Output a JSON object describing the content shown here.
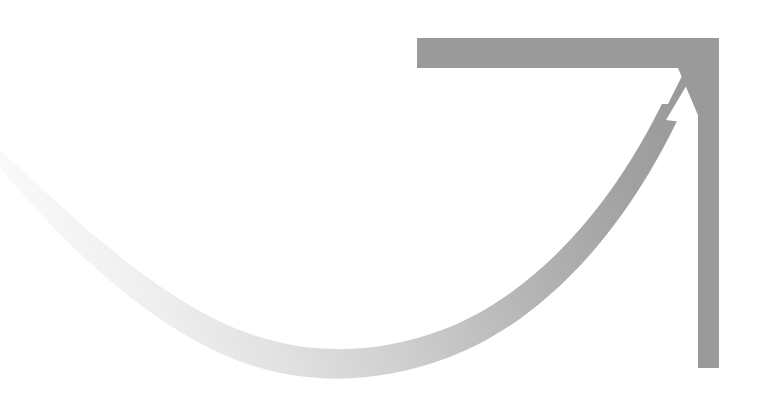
{
  "canvas": {
    "width": 780,
    "height": 409,
    "background": "#ffffff",
    "title": "Upward growth arrow graphic"
  },
  "palette": {
    "background": "#ffffff",
    "bracket_gray": "#9a9a9a",
    "curve_dark": "#9a9a9a",
    "curve_mid": "#c6c6c6",
    "curve_light": "#e9e9e9",
    "curve_faint": "#fbfbfb"
  },
  "shapes": {
    "top_bar": {
      "name": "top-horizontal-bar",
      "x": 417,
      "y": 38,
      "width": 302,
      "height": 30,
      "fill": "#9a9a9a"
    },
    "right_bar": {
      "name": "right-vertical-bar",
      "x": 698,
      "y": 38,
      "width": 21,
      "height": 330,
      "fill": "#9a9a9a"
    },
    "arrow_notch": {
      "name": "arrow-head-notch",
      "description": "white triangular wedge cut between the bracket corner and the rising curve",
      "points": "672,108 698,68 698,112",
      "fill": "#ffffff"
    },
    "curve": {
      "name": "sweeping-growth-curve",
      "description": "J shaped swoosh fading from near-white at far left to mid gray where it meets the arrow head",
      "stroke_width_left": 14,
      "stroke_width_right": 26,
      "start": [
        0,
        152
      ],
      "low_point": [
        340,
        350
      ],
      "end": [
        692,
        66
      ],
      "gradient_stops": [
        {
          "offset": "0%",
          "color": "#fdfdfd"
        },
        {
          "offset": "16%",
          "color": "#f2f2f2"
        },
        {
          "offset": "34%",
          "color": "#e2e2e2"
        },
        {
          "offset": "52%",
          "color": "#cdcdcd"
        },
        {
          "offset": "70%",
          "color": "#b4b4b4"
        },
        {
          "offset": "86%",
          "color": "#a2a2a2"
        },
        {
          "offset": "100%",
          "color": "#989898"
        }
      ]
    }
  },
  "labels": {
    "figure_caption": "Upward growth arrow graphic"
  }
}
